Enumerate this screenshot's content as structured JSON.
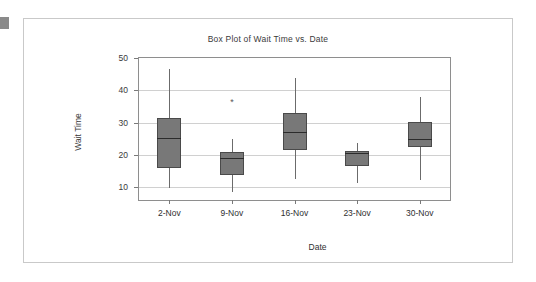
{
  "chart_data": {
    "type": "box",
    "title": "Box Plot of Wait Time vs. Date",
    "xlabel": "Date",
    "ylabel": "Wait Time",
    "categories": [
      "2-Nov",
      "9-Nov",
      "16-Nov",
      "23-Nov",
      "30-Nov"
    ],
    "ylim": [
      6,
      51
    ],
    "yticks": [
      10,
      20,
      30,
      40,
      50
    ],
    "ytick_labels": [
      "10",
      "20",
      "30",
      "40",
      "50"
    ],
    "grid": "horizontal",
    "legend": "none",
    "box_fill_color": "#787878",
    "box_edge_color": "#4a4a4a",
    "median_color": "#2b2b2b",
    "gridline_color": "#d0d0d0",
    "axis_color": "#8e8e8e",
    "boxes": [
      {
        "category": "2-Nov",
        "whisker_low": 9.7,
        "q1": 16.0,
        "median": 25.3,
        "q3": 31.5,
        "whisker_high": 46.7,
        "outliers": []
      },
      {
        "category": "9-Nov",
        "whisker_low": 8.6,
        "q1": 13.7,
        "median": 19.1,
        "q3": 21.0,
        "whisker_high": 24.8,
        "outliers": [
          36.0
        ]
      },
      {
        "category": "16-Nov",
        "whisker_low": 12.4,
        "q1": 21.4,
        "median": 27.1,
        "q3": 33.0,
        "whisker_high": 43.8,
        "outliers": []
      },
      {
        "category": "23-Nov",
        "whisker_low": 11.2,
        "q1": 16.6,
        "median": 20.4,
        "q3": 21.3,
        "whisker_high": 23.7,
        "outliers": []
      },
      {
        "category": "30-Nov",
        "whisker_low": 12.3,
        "q1": 22.3,
        "median": 25.0,
        "q3": 30.3,
        "whisker_high": 38.0,
        "outliers": []
      }
    ],
    "outlier_glyph": "*"
  }
}
